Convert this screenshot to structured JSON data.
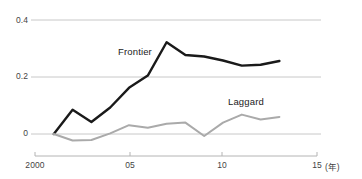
{
  "chart_data": {
    "type": "line",
    "title": "",
    "subtitle": "",
    "xlabel": "(年)",
    "ylabel": "",
    "xlim": [
      2000,
      2015
    ],
    "ylim": [
      -0.04,
      0.42
    ],
    "grid": true,
    "gridlines_y": [
      0,
      0.2,
      0.4
    ],
    "legend_position": "inline-annotation",
    "x_tick_labels": [
      "2000",
      "05",
      "10",
      "15"
    ],
    "x_tick_values": [
      2000,
      2005,
      2010,
      2015
    ],
    "y_tick_labels": [
      "0",
      "0.2",
      "0.4"
    ],
    "y_tick_values": [
      0,
      0.2,
      0.4
    ],
    "x": [
      2001,
      2002,
      2003,
      2004,
      2005,
      2006,
      2007,
      2008,
      2009,
      2010,
      2011,
      2012,
      2013
    ],
    "series": [
      {
        "name": "Frontier",
        "color": "#1a1a1a",
        "width": 2.4,
        "values": [
          0.0,
          0.085,
          0.042,
          0.093,
          0.162,
          0.205,
          0.322,
          0.277,
          0.272,
          0.258,
          0.24,
          0.243,
          0.256
        ]
      },
      {
        "name": "Laggard",
        "color": "#aaaaaa",
        "width": 2.0,
        "values": [
          0.0,
          -0.023,
          -0.021,
          0.002,
          0.031,
          0.022,
          0.036,
          0.04,
          -0.007,
          0.04,
          0.068,
          0.051,
          0.06
        ]
      }
    ],
    "annotations": [
      {
        "text": "Frontier",
        "x_px": 118,
        "y_px": 46
      },
      {
        "text": "Laggard",
        "x_px": 228,
        "y_px": 96
      }
    ],
    "axis_color": "#b4b4b4",
    "grid_color": "#c8c8c8",
    "text_color": "#444444"
  },
  "y_axis": {
    "ticks": [
      {
        "label": "0.4",
        "y_px": 21
      },
      {
        "label": "0.2",
        "y_px": 77
      },
      {
        "label": "0",
        "y_px": 134
      }
    ]
  },
  "x_axis": {
    "unit_label": "(年)",
    "ticks": [
      {
        "label": "2000",
        "x_px": 35
      },
      {
        "label": "05",
        "x_px": 130
      },
      {
        "label": "10",
        "x_px": 222
      },
      {
        "label": "15",
        "x_px": 317
      }
    ]
  }
}
